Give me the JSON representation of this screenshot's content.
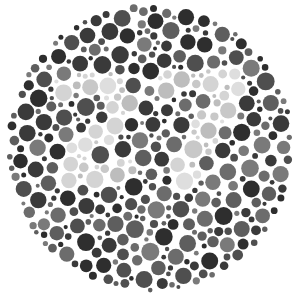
{
  "plate": {
    "type": "ishihara-style color vision test plate (grayscale)",
    "hidden_number": "27",
    "center": [
      150,
      148
    ],
    "radius": 145,
    "colors": {
      "background": "#ffffff",
      "figure_dots": [
        "#c8c8c8",
        "#d4d4d4",
        "#bdbdbd",
        "#dedede"
      ],
      "ground_dots": [
        "#3a3a3a",
        "#4f4f4f",
        "#5e5e5e",
        "#6c6c6c",
        "#7a7a7a",
        "#2e2e2e"
      ]
    }
  }
}
